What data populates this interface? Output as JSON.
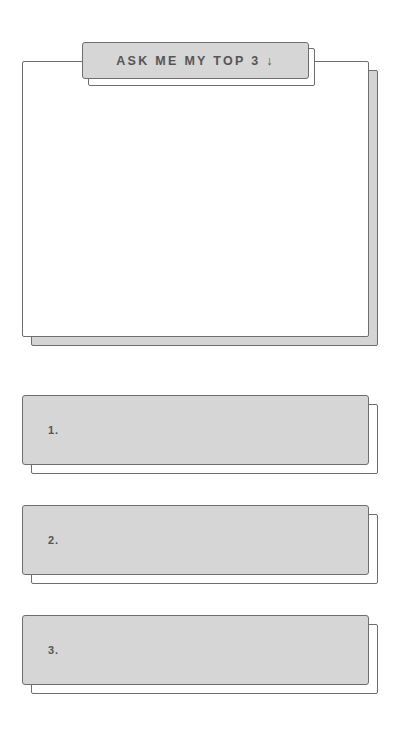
{
  "header_button": {
    "label": "ASK ME MY TOP 3 ↓"
  },
  "answer_panel": {
    "text": ""
  },
  "top_list": [
    {
      "number": "1.",
      "text": ""
    },
    {
      "number": "2.",
      "text": ""
    },
    {
      "number": "3.",
      "text": ""
    }
  ],
  "colors": {
    "border": "#6e6e6e",
    "fill_gray": "#d6d6d6",
    "text": "#555555",
    "background": "#ffffff"
  }
}
